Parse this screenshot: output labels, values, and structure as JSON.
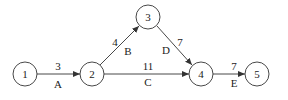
{
  "diagram": {
    "type": "activity-on-arrow network",
    "nodes": [
      {
        "id": "1",
        "label": "1",
        "x": 25,
        "y": 74
      },
      {
        "id": "2",
        "label": "2",
        "x": 92,
        "y": 74
      },
      {
        "id": "3",
        "label": "3",
        "x": 148,
        "y": 17
      },
      {
        "id": "4",
        "label": "4",
        "x": 201,
        "y": 74
      },
      {
        "id": "5",
        "label": "5",
        "x": 257,
        "y": 74
      }
    ],
    "edges": [
      {
        "from": "1",
        "to": "2",
        "activity": "A",
        "duration": "3"
      },
      {
        "from": "2",
        "to": "3",
        "activity": "B",
        "duration": "4"
      },
      {
        "from": "2",
        "to": "4",
        "activity": "C",
        "duration": "11"
      },
      {
        "from": "3",
        "to": "4",
        "activity": "D",
        "duration": "7"
      },
      {
        "from": "4",
        "to": "5",
        "activity": "E",
        "duration": "7"
      }
    ],
    "colors": {
      "stroke": "#333333",
      "text": "#222222",
      "background": "#ffffff"
    }
  }
}
